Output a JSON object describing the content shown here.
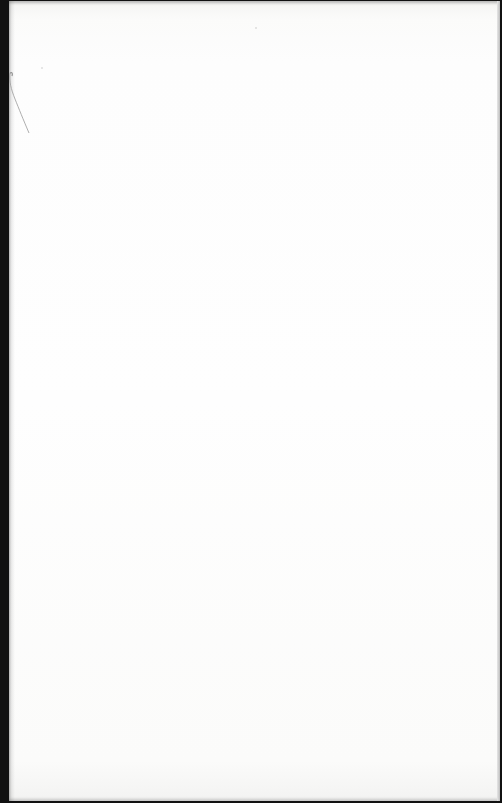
{
  "document": {
    "type": "scanned-page",
    "content": "",
    "state": "blank",
    "colors": {
      "binding_edge": "#111111",
      "paper": "#fdfdfd",
      "right_border": "#bdbdbd"
    }
  }
}
